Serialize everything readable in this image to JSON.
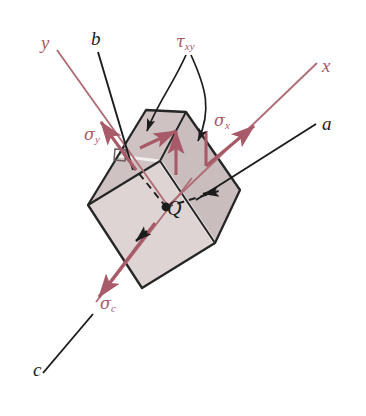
{
  "figure": {
    "type": "mechanics-stress-element-diagram",
    "background_color": "#ffffff",
    "colors": {
      "axis_pink": "#a85a68",
      "stress_arrow_pink": "#a85a68",
      "outline_black": "#1c1c1c",
      "top_face_fill": "#c8bcbd",
      "front_face_fill": "#ded4d4",
      "right_face_fill": "#cdc2c3",
      "highlight_fill": "#efe9e9"
    },
    "labels": {
      "axis_y": "y",
      "axis_x": "x",
      "axis_a": "a",
      "axis_b": "b",
      "axis_c": "c",
      "point_q": "Q",
      "sigma_x": "σ",
      "sigma_x_sub": "x",
      "sigma_y": "σ",
      "sigma_y_sub": "y",
      "sigma_c": "σ",
      "sigma_c_sub": "c",
      "tau_xy": "τ",
      "tau_xy_sub": "xy"
    },
    "elements": [
      {
        "name": "axis-y",
        "kind": "axis-line",
        "color": "pink",
        "direction": "upper-left"
      },
      {
        "name": "axis-x",
        "kind": "axis-line",
        "color": "pink",
        "direction": "upper-right"
      },
      {
        "name": "axis-a",
        "kind": "axis-line",
        "color": "black",
        "direction": "upper-right"
      },
      {
        "name": "axis-b",
        "kind": "axis-line",
        "color": "black",
        "direction": "upper-left"
      },
      {
        "name": "axis-c",
        "kind": "axis-line",
        "color": "black",
        "direction": "lower-left"
      },
      {
        "name": "sigma-x-arrow",
        "kind": "stress-arrow",
        "color": "pink"
      },
      {
        "name": "sigma-y-arrow",
        "kind": "stress-arrow",
        "color": "pink"
      },
      {
        "name": "sigma-c-arrow",
        "kind": "stress-arrow",
        "color": "pink"
      },
      {
        "name": "tau-xy-arrow-left",
        "kind": "shear-arrow",
        "color": "pink"
      },
      {
        "name": "tau-xy-arrow-right",
        "kind": "shear-arrow",
        "color": "pink"
      },
      {
        "name": "stress-element-block",
        "kind": "parallelepiped"
      },
      {
        "name": "point-q-dot",
        "kind": "marker"
      }
    ]
  }
}
